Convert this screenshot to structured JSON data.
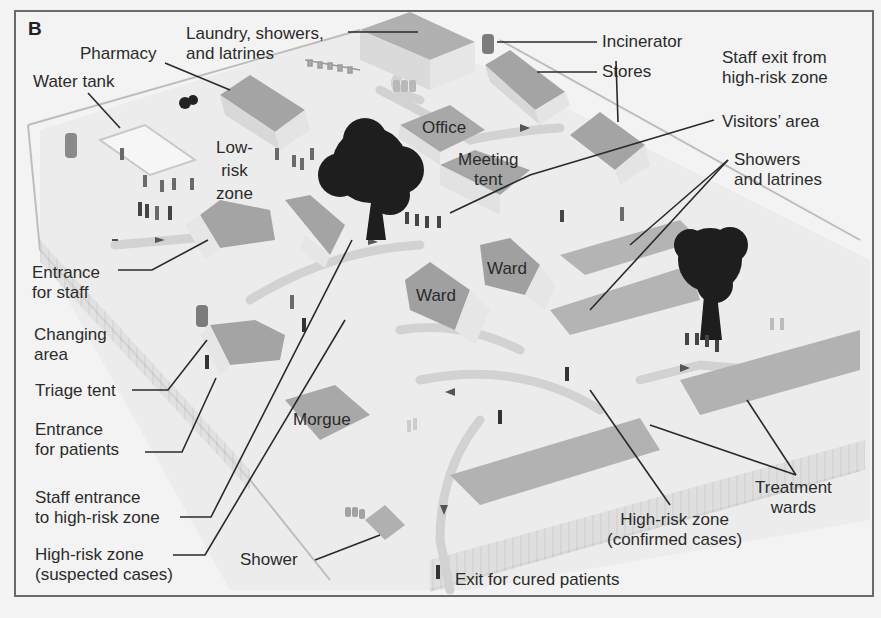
{
  "figure": {
    "panel_label": "B",
    "colors": {
      "background": "#f3f3f3",
      "frame": "#6a6a6a",
      "roof": "#a4a4a4",
      "roof_dark": "#8f8f8f",
      "wall": "#e6e6e6",
      "ground": "#ececec",
      "path": "#d0d0d0",
      "tree": "#1e1e1e",
      "leader_line": "#2a2a2a",
      "fence": "#bdbdbd",
      "barrel": "#7a7a7a"
    }
  },
  "labels": {
    "laundry": [
      "Laundry, showers,",
      "and latrines"
    ],
    "pharmacy": "Pharmacy",
    "water_tank": "Water tank",
    "incinerator": "Incinerator",
    "stores": "Stores",
    "staff_exit": [
      "Staff exit from",
      "high-risk zone"
    ],
    "visitors_area": "Visitors’ area",
    "showers_latrines": [
      "Showers",
      "and latrines"
    ],
    "low_risk_zone": [
      "Low-",
      "risk",
      "zone"
    ],
    "office": "Office",
    "meeting_tent": [
      "Meeting",
      "tent"
    ],
    "entrance_staff": [
      "Entrance",
      "for staff"
    ],
    "changing_area": [
      "Changing",
      "area"
    ],
    "triage_tent": "Triage tent",
    "entrance_patients": [
      "Entrance",
      "for patients"
    ],
    "staff_entrance_high_risk": [
      "Staff entrance",
      "to high-risk zone"
    ],
    "high_risk_suspected": [
      "High-risk zone",
      "(suspected cases)"
    ],
    "ward_1": "Ward",
    "ward_2": "Ward",
    "morgue": "Morgue",
    "shower": "Shower",
    "high_risk_confirmed": [
      "High-risk zone",
      "(confirmed cases)"
    ],
    "treatment_wards": [
      "Treatment",
      "wards"
    ],
    "exit_cured": "Exit for cured patients"
  }
}
